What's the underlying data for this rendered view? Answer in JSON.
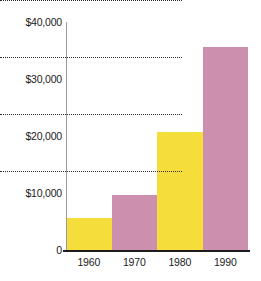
{
  "chart_data": {
    "type": "bar",
    "title": "",
    "xlabel": "",
    "ylabel": "",
    "categories": [
      "1960",
      "1970",
      "1980",
      "1990"
    ],
    "values": [
      5700,
      9600,
      20700,
      35600
    ],
    "series": [
      {
        "name": "Value",
        "values": [
          5700,
          9600,
          20700,
          35600
        ]
      }
    ],
    "bar_colors": [
      "#f5de3c",
      "#cc8fad",
      "#f5de3c",
      "#cc8fad"
    ],
    "ylim": [
      0,
      40000
    ],
    "xlim_categories": 4,
    "y_ticks": [
      0,
      10000,
      20000,
      30000,
      40000
    ],
    "y_tick_labels": [
      "0",
      "$10,000",
      "$20,000",
      "$30,000",
      "$40,000"
    ],
    "x_tick_labels": [
      "1960",
      "1970",
      "1980",
      "1990"
    ],
    "grid": true,
    "grid_style": "dotted",
    "grid_axis": "y",
    "legend": false,
    "legend_position": "none",
    "bar_gap": 0
  },
  "colors": {
    "yellow": "#f5de3c",
    "mauve": "#cc8fad",
    "grid": "#2b2b2b",
    "axis": "#1c1c1c",
    "y_axis": "#9a9a9a",
    "text": "#1a1a1a",
    "background": "#ffffff"
  },
  "axis": {
    "y_labels": [
      {
        "text": "$40,000",
        "value": 40000
      },
      {
        "text": "$30,000",
        "value": 30000
      },
      {
        "text": "$20,000",
        "value": 20000
      },
      {
        "text": "$10,000",
        "value": 10000
      },
      {
        "text": "0",
        "value": 0
      }
    ],
    "x_labels": [
      {
        "text": "1960"
      },
      {
        "text": "1970"
      },
      {
        "text": "1980"
      },
      {
        "text": "1990"
      }
    ]
  },
  "title_strip": ""
}
